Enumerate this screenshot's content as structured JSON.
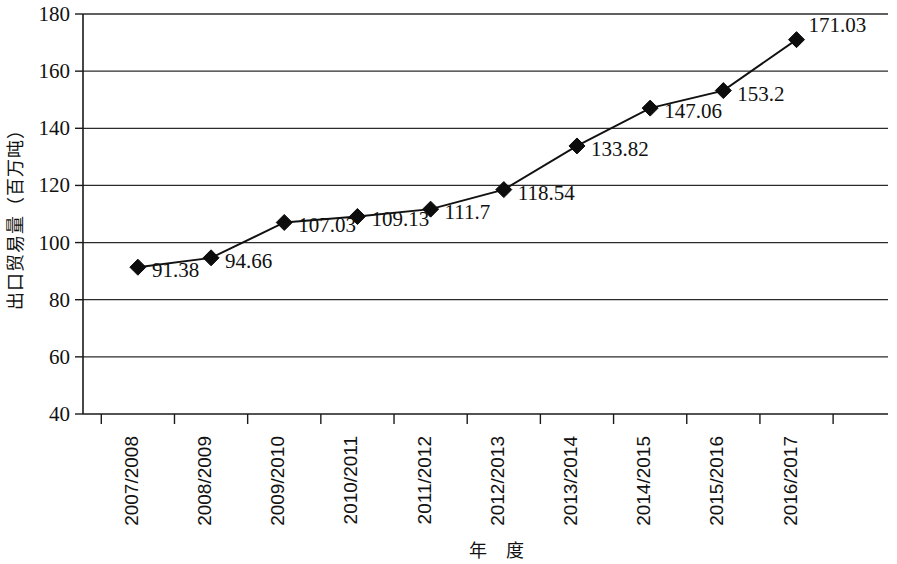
{
  "chart_data": {
    "type": "line",
    "title": "",
    "xlabel": "年 度",
    "ylabel": "出口贸易量（百万吨）",
    "categories": [
      "2007/2008",
      "2008/2009",
      "2009/2010",
      "2010/2011",
      "2011/2012",
      "2012/2013",
      "2013/2014",
      "2014/2015",
      "2015/2016",
      "2016/2017"
    ],
    "values": [
      91.38,
      94.66,
      107.03,
      109.13,
      111.7,
      118.54,
      133.82,
      147.06,
      153.2,
      171.03
    ],
    "point_labels": [
      "91.38",
      "94.66",
      "107.03",
      "109.13",
      "111.7",
      "118.54",
      "133.82",
      "147.06",
      "153.2",
      "171.03"
    ],
    "ylim": [
      40,
      180
    ],
    "y_ticks": [
      40,
      60,
      80,
      100,
      120,
      140,
      160,
      180
    ],
    "y_tick_labels": [
      "40",
      "60",
      "80",
      "100",
      "120",
      "140",
      "160",
      "180"
    ],
    "grid": true,
    "grid_axis": "y",
    "legend": false,
    "legend_position": "none",
    "marker": "diamond",
    "series_color": "#111111",
    "grid_color": "#2b2b2b",
    "background_color": "#ffffff"
  }
}
